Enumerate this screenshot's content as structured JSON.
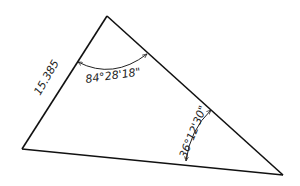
{
  "diagram": {
    "type": "triangle",
    "vertices": {
      "top": [
        107,
        16
      ],
      "left": [
        22,
        149
      ],
      "right": [
        283,
        175
      ]
    },
    "labels": {
      "side_left": "15.385",
      "angle_top": "84°28'18\"",
      "angle_right": "36°12'30\""
    },
    "colors": {
      "line": "#111111",
      "text": "#222222",
      "background": "#ffffff"
    }
  }
}
